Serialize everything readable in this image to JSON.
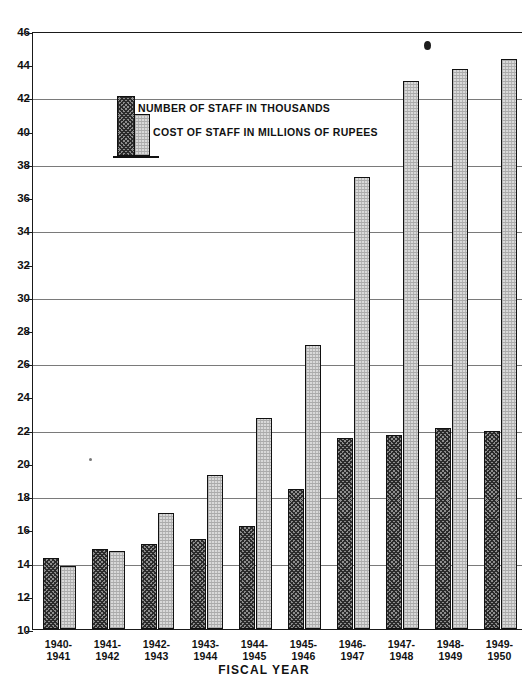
{
  "chart_data": {
    "type": "bar",
    "title": "",
    "xlabel": "FISCAL YEAR",
    "ylabel": "",
    "ylim": [
      10,
      46
    ],
    "ytick_step": 2,
    "grid": true,
    "legend_position": "top-left",
    "categories": [
      "1940-\n1941",
      "1941-\n1942",
      "1942-\n1943",
      "1943-\n1944",
      "1944-\n1945",
      "1945-\n1946",
      "1946-\n1947",
      "1947-\n1948",
      "1948-\n1949",
      "1949-\n1950"
    ],
    "category_lines": [
      [
        "1940-",
        "1941"
      ],
      [
        "1941-",
        "1942"
      ],
      [
        "1942-",
        "1943"
      ],
      [
        "1943-",
        "1944"
      ],
      [
        "1944-",
        "1945"
      ],
      [
        "1945-",
        "1946"
      ],
      [
        "1946-",
        "1947"
      ],
      [
        "1947-",
        "1948"
      ],
      [
        "1948-",
        "1949"
      ],
      [
        "1949-",
        "1950"
      ]
    ],
    "yticks": [
      10,
      12,
      14,
      16,
      18,
      20,
      22,
      24,
      26,
      28,
      30,
      32,
      34,
      36,
      38,
      40,
      42,
      44,
      46
    ],
    "ytick_labels": [
      "10",
      "12",
      "14",
      "16",
      "18",
      "20",
      "22",
      "24",
      "26",
      "28",
      "30",
      "32",
      "34",
      "36",
      "38",
      "40",
      "42",
      "44",
      "46"
    ],
    "series": [
      {
        "name": "NUMBER OF STAFF IN THOUSANDS",
        "key": "staff",
        "pattern": "cross-hatch-dark",
        "color": "#8e8e8e",
        "values": [
          14.3,
          14.8,
          15.1,
          15.4,
          16.2,
          18.4,
          21.5,
          21.7,
          22.1,
          21.9
        ]
      },
      {
        "name": "COST OF STAFF IN MILLIONS OF RUPEES",
        "key": "cost",
        "pattern": "stipple-light",
        "color": "#d9d9d9",
        "values": [
          13.8,
          14.7,
          17.0,
          19.3,
          22.7,
          27.1,
          37.2,
          43.0,
          43.7,
          44.3
        ]
      }
    ]
  },
  "legend": {
    "staff_label": "NUMBER OF STAFF IN THOUSANDS",
    "cost_label": "COST OF STAFF IN MILLIONS OF RUPEES"
  },
  "axis": {
    "x_title": "FISCAL YEAR"
  }
}
